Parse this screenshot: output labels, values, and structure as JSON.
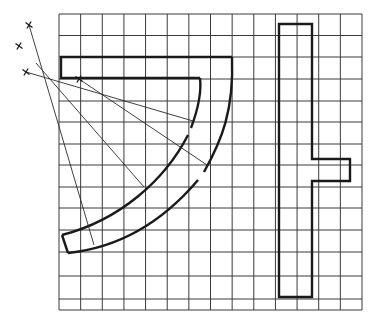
{
  "diagram": {
    "grid": {
      "x0": 59,
      "y0": 14,
      "x1": 362,
      "y1": 310,
      "cols": 14,
      "rows": 13,
      "color": "#3a3a3a"
    },
    "stroke_color": "#1a1a1a",
    "marks": [
      {
        "label": "x",
        "x": 29,
        "y": 25
      },
      {
        "label": "x",
        "x": 19,
        "y": 46
      },
      {
        "label": "x",
        "x": 26,
        "y": 72
      },
      {
        "label": "x",
        "x": 79,
        "y": 79
      }
    ],
    "quarter_ring": {
      "outer_top_left": [
        61,
        57
      ],
      "outer_top_right": [
        232,
        57
      ],
      "inner_corner": [
        61,
        78
      ],
      "inner_start": [
        200,
        78
      ],
      "inner_end": [
        62,
        235
      ],
      "outer_end": [
        68,
        253
      ]
    },
    "t_bar": {
      "points": [
        [
          279,
          24
        ],
        [
          312,
          24
        ],
        [
          312,
          159
        ],
        [
          350,
          159
        ],
        [
          350,
          181
        ],
        [
          312,
          181
        ],
        [
          312,
          297
        ],
        [
          279,
          297
        ]
      ]
    },
    "rays": [
      {
        "from": [
          29,
          25
        ],
        "to": [
          94,
          245
        ]
      },
      {
        "from": [
          26,
          72
        ],
        "to": [
          193,
          121
        ]
      },
      {
        "from": [
          79,
          79
        ],
        "to": [
          207,
          165
        ]
      },
      {
        "from": [
          36,
          63
        ],
        "to": [
          144,
          187
        ]
      }
    ]
  }
}
